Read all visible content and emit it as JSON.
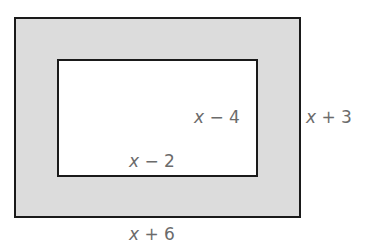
{
  "diagram": {
    "outer_rectangle": {
      "width_label": "x + 6",
      "height_label": "x + 3",
      "fill": "#dcdcdc"
    },
    "inner_rectangle": {
      "width_label": "x − 2",
      "height_label": "x − 4",
      "fill": "#ffffff"
    },
    "stroke_color": "#1a1a1a",
    "label_color": "#6b6b6b"
  }
}
